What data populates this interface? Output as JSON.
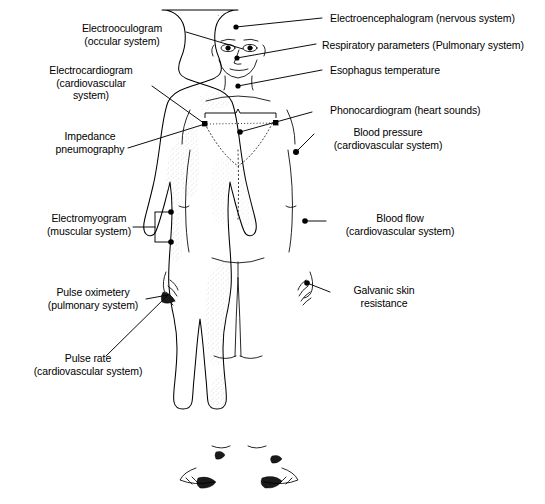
{
  "diagram": {
    "figure_name": "human-body-front-view",
    "line_color": "#000000",
    "background_color": "#ffffff",
    "stipple_color": "#9a9a9a"
  },
  "labels": [
    {
      "id": "electrooculogram",
      "text": "Electrooculogram\n(occular system)",
      "side": "left",
      "align": "center",
      "x": 62,
      "y": 22,
      "width": 120,
      "anchor_site": "eye"
    },
    {
      "id": "electrocardiogram",
      "text": "Electrocardiogram\n(cardiovascular\nsystem)",
      "side": "left",
      "align": "center",
      "x": 26,
      "y": 64,
      "width": 130,
      "anchor_site": "left-chest-electrode"
    },
    {
      "id": "impedance-pneumography",
      "text": "Impedance\npneumography",
      "side": "left",
      "align": "center",
      "x": 30,
      "y": 130,
      "width": 120,
      "anchor_site": "left-chest-electrode"
    },
    {
      "id": "electromyogram",
      "text": "Electromyogram\n(muscular system)",
      "side": "left",
      "align": "center",
      "x": 30,
      "y": 212,
      "width": 118,
      "anchor_site": "left-forearm-bracket"
    },
    {
      "id": "pulse-oximetery",
      "text": "Pulse oximetery\n(pulmonary system)",
      "side": "left",
      "align": "center",
      "x": 28,
      "y": 286,
      "width": 130,
      "anchor_site": "left-fingertip"
    },
    {
      "id": "pulse-rate",
      "text": "Pulse rate\n(cardiovascular system)",
      "side": "left",
      "align": "center",
      "x": 14,
      "y": 352,
      "width": 148,
      "anchor_site": "left-fingertip"
    },
    {
      "id": "electroencephalogram",
      "text": "Electroencephalogram (nervous system)",
      "side": "right",
      "align": "left",
      "x": 330,
      "y": 12,
      "width": 214,
      "anchor_site": "forehead"
    },
    {
      "id": "respiratory-parameters",
      "text": "Respiratory parameters (Pulmonary system)",
      "side": "right",
      "align": "left",
      "x": 322,
      "y": 39,
      "width": 222,
      "anchor_site": "nose"
    },
    {
      "id": "esophagus-temperature",
      "text": "Esophagus temperature",
      "side": "right",
      "align": "left",
      "x": 330,
      "y": 64,
      "width": 160,
      "anchor_site": "throat"
    },
    {
      "id": "phonocardiogram",
      "text": "Phonocardiogram (heart sounds)",
      "side": "right",
      "align": "left",
      "x": 330,
      "y": 104,
      "width": 186,
      "anchor_site": "mid-chest-electrode"
    },
    {
      "id": "blood-pressure",
      "text": "Blood pressure\n(cardiovascular system)",
      "side": "right",
      "align": "center",
      "x": 318,
      "y": 126,
      "width": 140,
      "anchor_site": "right-upper-arm"
    },
    {
      "id": "blood-flow",
      "text": "Blood flow\n(cardiovascular system)",
      "side": "right",
      "align": "center",
      "x": 330,
      "y": 212,
      "width": 140,
      "anchor_site": "right-forearm"
    },
    {
      "id": "galvanic-skin-resistance",
      "text": "Galvanic skin\nresistance",
      "side": "right",
      "align": "center",
      "x": 336,
      "y": 284,
      "width": 96,
      "anchor_site": "right-hand"
    }
  ],
  "measurement_sites": [
    {
      "id": "forehead",
      "label_id": "electroencephalogram",
      "x": 236,
      "y": 27
    },
    {
      "id": "eye",
      "label_id": "electrooculogram",
      "x": 243,
      "y": 49
    },
    {
      "id": "nose",
      "label_id": "respiratory-parameters",
      "x": 237,
      "y": 58
    },
    {
      "id": "throat",
      "label_id": "esophagus-temperature",
      "x": 238,
      "y": 86
    },
    {
      "id": "left-chest-electrode",
      "label_id": "electrocardiogram",
      "x": 205,
      "y": 124
    },
    {
      "id": "right-chest-electrode",
      "label_id": "impedance-pneumography",
      "x": 276,
      "y": 123
    },
    {
      "id": "mid-chest-electrode",
      "label_id": "phonocardiogram",
      "x": 240,
      "y": 132
    },
    {
      "id": "right-upper-arm",
      "label_id": "blood-pressure",
      "x": 296,
      "y": 152
    },
    {
      "id": "left-forearm-upper",
      "label_id": "electromyogram",
      "x": 171,
      "y": 212
    },
    {
      "id": "left-forearm-lower",
      "label_id": "electromyogram",
      "x": 171,
      "y": 242
    },
    {
      "id": "right-forearm",
      "label_id": "blood-flow",
      "x": 305,
      "y": 221
    },
    {
      "id": "right-hand",
      "label_id": "galvanic-skin-resistance",
      "x": 307,
      "y": 283
    },
    {
      "id": "left-fingertip",
      "label_id": "pulse-oximetery",
      "x": 168,
      "y": 295
    }
  ]
}
